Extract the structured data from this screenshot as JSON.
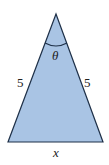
{
  "diagram": {
    "shape": "isosceles-triangle",
    "fill_color": "#a9c4e4",
    "stroke_color": "#1e3048",
    "labels": {
      "left_side": "5",
      "right_side": "5",
      "base": "x",
      "apex_angle": "θ"
    }
  }
}
